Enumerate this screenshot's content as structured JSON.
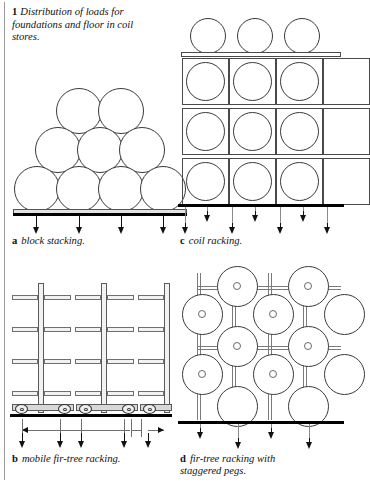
{
  "figure": {
    "number": "1",
    "caption": "Distribution of loads for foundations and floor in coil stores."
  },
  "panels": [
    {
      "id": "a",
      "letter": "a",
      "label": "block stacking.",
      "type": "block-stack",
      "coil_rows": [
        4,
        3,
        2
      ],
      "load_arrow_count": 4
    },
    {
      "id": "c",
      "letter": "c",
      "label": "coil racking.",
      "type": "rack-grid",
      "grid_columns": 3,
      "grid_rows": 3,
      "coils_on_top": 3,
      "load_arrow_count": 6
    },
    {
      "id": "b",
      "letter": "b",
      "label": "mobile fir-tree racking.",
      "type": "mobile-fir-tree",
      "mast_count": 2,
      "arm_levels": 4,
      "wheels_per_trolley": 2,
      "load_arrow_count": 5,
      "has_travel_dimension": true,
      "has_aisle_gap_dimension": true
    },
    {
      "id": "d",
      "letter": "d",
      "label": "fir-tree racking with staggered pegs.",
      "label_line_1": "fir-tree racking with",
      "label_line_2": "staggered pegs.",
      "type": "staggered-peg-rack",
      "coil_columns": 4,
      "coil_rows": 3,
      "load_arrow_count": 4
    }
  ],
  "colors": {
    "ground_line": "#000000",
    "outline": "#3a3a3a",
    "structure": "#7a7a7a",
    "fill": "#ffffff",
    "plinth": "#e2e2e2",
    "page_rule": "#9a9a9a"
  },
  "icons": {
    "load_arrow": "down-arrow-icon",
    "dimension_arrow": "dimension-arrow-icon",
    "wheel": "wheel-icon",
    "coil": "coil-circle-icon",
    "coil_hole": "coil-hole-icon"
  }
}
